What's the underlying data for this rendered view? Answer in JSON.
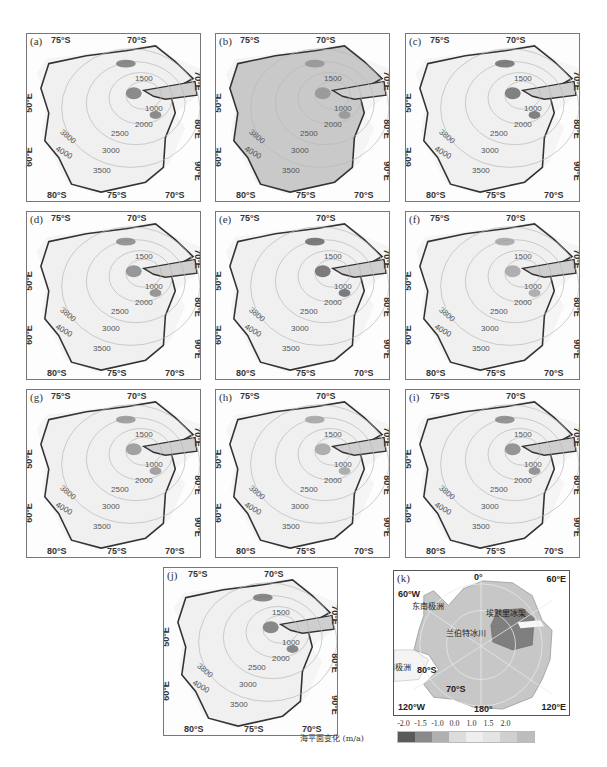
{
  "figure": {
    "panels": [
      {
        "label": "(a)",
        "variant": "a"
      },
      {
        "label": "(b)",
        "variant": "b"
      },
      {
        "label": "(c)",
        "variant": "c"
      },
      {
        "label": "(d)",
        "variant": "d"
      },
      {
        "label": "(e)",
        "variant": "e"
      },
      {
        "label": "(f)",
        "variant": "f"
      },
      {
        "label": "(g)",
        "variant": "g"
      },
      {
        "label": "(h)",
        "variant": "h"
      },
      {
        "label": "(i)",
        "variant": "i"
      },
      {
        "label": "(j)",
        "variant": "j"
      }
    ],
    "axis_labels": {
      "top": [
        "75°S",
        "70°S"
      ],
      "bottom": [
        "80°S",
        "75°S",
        "70°S"
      ],
      "left": [
        "50°E",
        "60°E"
      ],
      "right": [
        "70°E",
        "80°E",
        "90°E"
      ]
    },
    "contours": [
      "1500",
      "1000",
      "2000",
      "2500",
      "3000",
      "3500",
      "3800",
      "4000"
    ],
    "overview": {
      "label": "(k)",
      "corners": {
        "top_left": "60°W",
        "top_center": "0°",
        "top_right": "60°E",
        "bottom_left": "120°W",
        "bottom_center": "180°",
        "bottom_right": "120°E"
      },
      "latitudes": [
        "80°S",
        "70°S"
      ],
      "regions": {
        "east": "东南极洲",
        "west": "西南极洲",
        "basin": "兰伯特冰川",
        "shelf": "埃默里冰架"
      }
    },
    "legend": {
      "title": "海平面变化 (m/a)",
      "ticks": [
        "-2.0",
        "-1.5",
        "-1.0",
        "0.0",
        "1.0",
        "1.5",
        "2.0"
      ],
      "colors": [
        "#5a5a5a",
        "#8a8a8a",
        "#b0b0b0",
        "#dcdcdc",
        "#eeeeee",
        "#e4e4e4",
        "#d0d0d0",
        "#bdbdbd"
      ]
    }
  }
}
